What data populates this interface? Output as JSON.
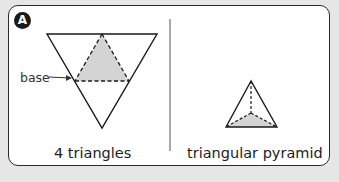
{
  "panel": {
    "badge": "A",
    "left": {
      "annotation": "base",
      "caption": "4 triangles"
    },
    "right": {
      "caption": "triangular pyramid"
    }
  },
  "colors": {
    "background": "#e6e6e6",
    "card": "#ffffff",
    "stroke": "#1a1a1a",
    "shade": "#d4d4d4"
  }
}
